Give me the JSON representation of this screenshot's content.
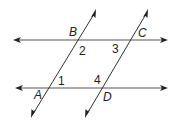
{
  "diagram": {
    "points": {
      "A": {
        "label": "A"
      },
      "B": {
        "label": "B"
      },
      "C": {
        "label": "C"
      },
      "D": {
        "label": "D"
      }
    },
    "angles": {
      "a1": "1",
      "a2": "2",
      "a3": "3",
      "a4": "4"
    },
    "colors": {
      "line": "#333333",
      "text": "#222222",
      "background": "#ffffff"
    }
  }
}
